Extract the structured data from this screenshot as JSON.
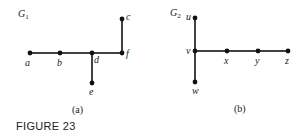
{
  "figure_label": "FIGURE 23",
  "graphs": [
    {
      "name": "G",
      "sub": "1",
      "caption": "(a)",
      "nodes": [
        {
          "id": "a",
          "x": 30,
          "y": 53,
          "lx": 25,
          "ly": 66
        },
        {
          "id": "b",
          "x": 60,
          "y": 53,
          "lx": 57,
          "ly": 66
        },
        {
          "id": "d",
          "x": 92,
          "y": 53,
          "lx": 94,
          "ly": 63
        },
        {
          "id": "f",
          "x": 122,
          "y": 53,
          "lx": 126,
          "ly": 57
        },
        {
          "id": "c",
          "x": 122,
          "y": 19,
          "lx": 126,
          "ly": 20
        },
        {
          "id": "e",
          "x": 92,
          "y": 83,
          "lx": 89,
          "ly": 95
        }
      ],
      "edges": [
        [
          "a",
          "b"
        ],
        [
          "b",
          "d"
        ],
        [
          "d",
          "f"
        ],
        [
          "f",
          "c"
        ],
        [
          "d",
          "e"
        ]
      ]
    },
    {
      "name": "G",
      "sub": "2",
      "caption": "(b)",
      "nodes": [
        {
          "id": "u",
          "x": 195,
          "y": 18,
          "lx": 186,
          "ly": 20
        },
        {
          "id": "v",
          "x": 195,
          "y": 51,
          "lx": 186,
          "ly": 54
        },
        {
          "id": "w",
          "x": 195,
          "y": 82,
          "lx": 192,
          "ly": 94
        },
        {
          "id": "x",
          "x": 227,
          "y": 51,
          "lx": 224,
          "ly": 64
        },
        {
          "id": "y",
          "x": 258,
          "y": 51,
          "lx": 255,
          "ly": 64
        },
        {
          "id": "z",
          "x": 288,
          "y": 51,
          "lx": 285,
          "ly": 64
        }
      ],
      "edges": [
        [
          "u",
          "v"
        ],
        [
          "v",
          "w"
        ],
        [
          "v",
          "x"
        ],
        [
          "x",
          "y"
        ],
        [
          "y",
          "z"
        ]
      ]
    }
  ]
}
